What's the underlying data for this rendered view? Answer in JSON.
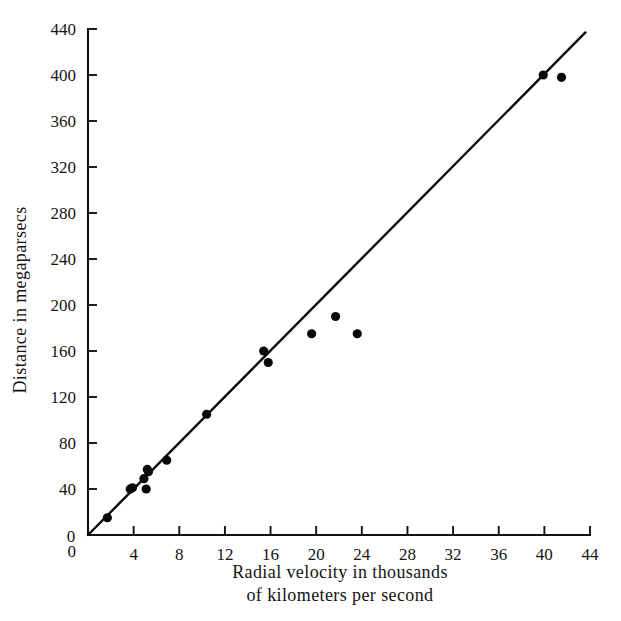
{
  "chart_data": {
    "type": "scatter",
    "title": "",
    "xlabel": "Radial velocity in thousands of kilometers per second",
    "xlabel_line1": "Radial velocity in thousands",
    "xlabel_line2": "of kilometers per second",
    "ylabel": "Distance in megaparsecs",
    "xlim": [
      0,
      44
    ],
    "ylim": [
      0,
      440
    ],
    "xticks": [
      0,
      4,
      8,
      12,
      16,
      20,
      24,
      28,
      32,
      36,
      40,
      44
    ],
    "xtick_labels": [
      "0",
      "4",
      "8",
      "12",
      "16",
      "20",
      "24",
      "28",
      "32",
      "36",
      "40",
      "44"
    ],
    "yticks": [
      0,
      40,
      80,
      120,
      160,
      200,
      240,
      280,
      320,
      360,
      400,
      440
    ],
    "ytick_labels": [
      "0",
      "40",
      "80",
      "120",
      "160",
      "200",
      "240",
      "280",
      "320",
      "360",
      "400",
      "440"
    ],
    "grid": false,
    "legend": "none",
    "marker_color": "#0a0a0a",
    "line_color": "#0b0b0b",
    "background_color": "#ffffff",
    "points": [
      {
        "x": 1.7,
        "y": 15
      },
      {
        "x": 3.7,
        "y": 40
      },
      {
        "x": 3.9,
        "y": 41
      },
      {
        "x": 4.9,
        "y": 49
      },
      {
        "x": 5.1,
        "y": 40
      },
      {
        "x": 5.2,
        "y": 57
      },
      {
        "x": 5.3,
        "y": 55
      },
      {
        "x": 6.9,
        "y": 65
      },
      {
        "x": 10.4,
        "y": 105
      },
      {
        "x": 15.4,
        "y": 160
      },
      {
        "x": 15.8,
        "y": 150
      },
      {
        "x": 19.6,
        "y": 175
      },
      {
        "x": 21.7,
        "y": 190
      },
      {
        "x": 23.6,
        "y": 175
      },
      {
        "x": 39.9,
        "y": 400
      },
      {
        "x": 41.5,
        "y": 398
      }
    ],
    "fit_line": {
      "name": "Hubble relation best-fit line",
      "x_start": 0.0,
      "y_start": 0,
      "x_end": 43.6,
      "y_end": 437
    }
  }
}
